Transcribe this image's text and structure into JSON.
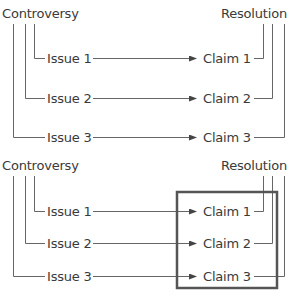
{
  "diagrams": [
    {
      "source_label": "Controversy",
      "target_label": "Resolution",
      "issues": [
        "Issue 1",
        "Issue 2",
        "Issue 3"
      ],
      "claims": [
        "Claim 1",
        "Claim 2",
        "Claim 3"
      ],
      "highlight_box": false
    },
    {
      "source_label": "Controversy",
      "target_label": "Resolution",
      "issues": [
        "Issue 1",
        "Issue 2",
        "Issue 3"
      ],
      "claims": [
        "Claim 1",
        "Claim 2",
        "Claim 3"
      ],
      "highlight_box": true
    }
  ],
  "colors": {
    "line": "#555555",
    "box": "#555555",
    "text": "#3a3a3a"
  }
}
